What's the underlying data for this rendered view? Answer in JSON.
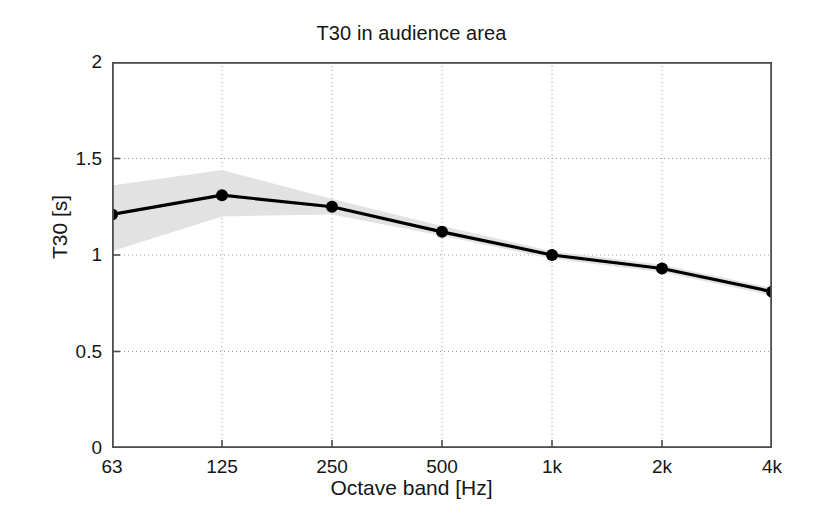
{
  "figure": {
    "title": "T30 in audience area",
    "background_color": "#ffffff"
  },
  "axes": {
    "xlabel": "Octave band [Hz]",
    "ylabel": "T30 [s]",
    "x_tick_labels": [
      "63",
      "125",
      "250",
      "500",
      "1k",
      "2k",
      "4k"
    ],
    "y_tick_labels": [
      "0",
      "0.5",
      "1",
      "1.5",
      "2"
    ],
    "axis_color": "#4d4d4d",
    "grid_color": "#9a9a9a"
  },
  "chart_data": {
    "type": "line",
    "title": "T30 in audience area",
    "xlabel": "Octave band [Hz]",
    "ylabel": "T30 [s]",
    "categories": [
      "63",
      "125",
      "250",
      "500",
      "1k",
      "2k",
      "4k"
    ],
    "xtick_labels": [
      "63",
      "125",
      "250",
      "500",
      "1k",
      "2k",
      "4k"
    ],
    "ytick_labels": [
      "0",
      "0.5",
      "1",
      "1.5",
      "2"
    ],
    "yticks": [
      0,
      0.5,
      1,
      1.5,
      2
    ],
    "ylim": [
      0,
      2
    ],
    "grid": true,
    "legend": null,
    "series": [
      {
        "name": "T30 mean",
        "values": [
          1.21,
          1.31,
          1.25,
          1.12,
          1.0,
          0.93,
          0.81
        ],
        "color": "#000000",
        "marker": "circle",
        "line_width": 3.2,
        "marker_size": 9
      },
      {
        "name": "T30 spread (shaded band)",
        "type": "band",
        "color": "#e2e2e2",
        "upper": [
          1.36,
          1.44,
          1.29,
          1.15,
          1.02,
          0.95,
          0.83
        ],
        "lower": [
          1.02,
          1.2,
          1.21,
          1.1,
          0.98,
          0.91,
          0.79
        ]
      }
    ]
  }
}
